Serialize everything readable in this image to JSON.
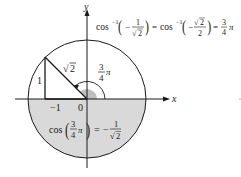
{
  "diagram": {
    "type": "unit-circle-arccos",
    "axes": {
      "x_label": "x",
      "y_label": "y"
    },
    "tick_labels": {
      "neg_one": "−1",
      "zero": "0"
    },
    "triangle": {
      "vertical_side": "1",
      "hypotenuse_radicand": "2"
    },
    "angle": {
      "numerator": "3",
      "denominator": "4",
      "pi": "π"
    },
    "top_equation": {
      "func": "cos",
      "sup": "−1",
      "frac1_num": "1",
      "frac1_den_radicand": "2",
      "equals": "=",
      "frac2_num_radicand": "2",
      "frac2_den": "2",
      "result_num": "3",
      "result_den": "4",
      "pi": "π",
      "minus": "−"
    },
    "bottom_equation": {
      "func": "cos",
      "arg_num": "3",
      "arg_den": "4",
      "pi": "π",
      "equals": "=",
      "minus": "−",
      "rhs_num": "1",
      "rhs_den_radicand": "2"
    },
    "colors": {
      "shade": "#d9d9d9",
      "angle_wedge": "#bfbfbf",
      "line": "#1a1a1a",
      "background": "#ffffff"
    }
  }
}
